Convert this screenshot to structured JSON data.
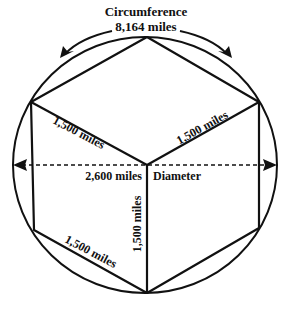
{
  "diagram": {
    "title": "Circumference",
    "circumference_value": "8,164 miles",
    "diameter_value": "2,600 miles",
    "diameter_label": "Diameter",
    "side_labels": [
      "1,500 miles",
      "1,500 miles",
      "1,500 miles",
      "1,500 miles"
    ],
    "colors": {
      "stroke": "#111111",
      "background": "#ffffff"
    },
    "shapes": {
      "circle": {
        "cx": 145,
        "cy": 165,
        "rx": 132,
        "ry": 128
      },
      "hexagon_vertices": [
        [
          147,
          37
        ],
        [
          259,
          102
        ],
        [
          259,
          228
        ],
        [
          147,
          293
        ],
        [
          34,
          230
        ],
        [
          31,
          102
        ]
      ],
      "center": [
        147,
        165
      ]
    }
  }
}
